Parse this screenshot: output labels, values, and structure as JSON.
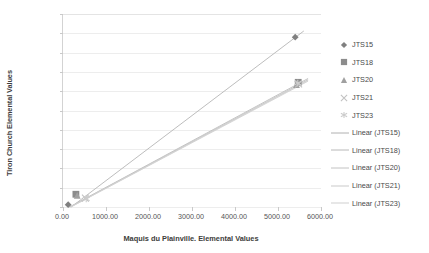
{
  "chart_data": {
    "type": "scatter",
    "title": "",
    "xlabel": "Maquis du Plainville. Elemental Values",
    "ylabel": "Tiron Church Elemental Values",
    "xlim": [
      0,
      6000
    ],
    "ylim": [
      0,
      5000
    ],
    "xticks": [
      "0.00",
      "1000.00",
      "2000.00",
      "3000.00",
      "4000.00",
      "5000.00",
      "6000.00"
    ],
    "xtick_values": [
      0,
      1000,
      2000,
      3000,
      4000,
      5000,
      6000
    ],
    "yticks": [
      "0.00",
      "500.00",
      "1000.00",
      "1500.00",
      "2000.00",
      "2500.00",
      "3000.00",
      "3500.00",
      "4000.00",
      "4500.00",
      "5000.00"
    ],
    "ytick_values": [
      0,
      500,
      1000,
      1500,
      2000,
      2500,
      3000,
      3500,
      4000,
      4500,
      5000
    ],
    "grid": "horizontal",
    "legend_position": "right",
    "series": [
      {
        "name": "JTS15",
        "marker": "diamond",
        "color": "#808080",
        "points": [
          [
            120,
            60
          ],
          [
            5400,
            4400
          ]
        ]
      },
      {
        "name": "JTS18",
        "marker": "square",
        "color": "#8c8c8c",
        "points": [
          [
            300,
            330
          ],
          [
            5470,
            3230
          ]
        ]
      },
      {
        "name": "JTS20",
        "marker": "triangle",
        "color": "#a0a0a0",
        "points": [
          [
            330,
            300
          ],
          [
            5430,
            3170
          ]
        ]
      },
      {
        "name": "JTS21",
        "marker": "x-cross",
        "color": "#c2c2c2",
        "points": [
          [
            520,
            230
          ],
          [
            5480,
            3190
          ]
        ]
      },
      {
        "name": "JTS23",
        "marker": "asterisk",
        "color": "#cccccc",
        "points": [
          [
            540,
            210
          ],
          [
            5460,
            3210
          ]
        ]
      }
    ],
    "trendlines": [
      {
        "name": "Linear (JTS15)",
        "color": "#b5b5b5",
        "from": [
          190,
          0
        ],
        "to": [
          5600,
          4560
        ]
      },
      {
        "name": "Linear (JTS18)",
        "color": "#bdbdbd",
        "from": [
          150,
          0
        ],
        "to": [
          5700,
          3330
        ]
      },
      {
        "name": "Linear (JTS20)",
        "color": "#c5c5c5",
        "from": [
          160,
          0
        ],
        "to": [
          5700,
          3300
        ]
      },
      {
        "name": "Linear (JTS21)",
        "color": "#cdcdcd",
        "from": [
          175,
          0
        ],
        "to": [
          5700,
          3280
        ]
      },
      {
        "name": "Linear (JTS23)",
        "color": "#d2d2d2",
        "from": [
          185,
          0
        ],
        "to": [
          5700,
          3260
        ]
      }
    ]
  },
  "legend": {
    "items": [
      {
        "label": "JTS15",
        "marker": "diamond",
        "color": "#808080"
      },
      {
        "label": "JTS18",
        "marker": "square",
        "color": "#8c8c8c"
      },
      {
        "label": "JTS20",
        "marker": "triangle",
        "color": "#a0a0a0"
      },
      {
        "label": "JTS21",
        "marker": "x-cross",
        "color": "#c2c2c2"
      },
      {
        "label": "JTS23",
        "marker": "asterisk",
        "color": "#cccccc"
      },
      {
        "label": "Linear (JTS15)",
        "marker": "line",
        "color": "#b0b0b0"
      },
      {
        "label": "Linear (JTS18)",
        "marker": "line",
        "color": "#b8b8b8"
      },
      {
        "label": "Linear (JTS20)",
        "marker": "line",
        "color": "#c2c2c2"
      },
      {
        "label": "Linear (JTS21)",
        "marker": "line",
        "color": "#c9c9c9"
      },
      {
        "label": "Linear (JTS23)",
        "marker": "line",
        "color": "#cfcfcf"
      }
    ]
  },
  "style": {
    "gridline_color": "#ededed",
    "axis_color": "#c9c9c9",
    "tick_label_color": "#555555",
    "axis_title_color": "#3d3d3d",
    "plot_background": "#ffffff"
  }
}
